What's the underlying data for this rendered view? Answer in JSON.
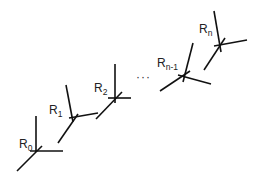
{
  "diagram": {
    "type": "serial kinematic chain of coordinate frames",
    "line_color": "#111111",
    "background": "#ffffff",
    "frames": [
      {
        "id": "R0",
        "base": "R",
        "sub": "0"
      },
      {
        "id": "R1",
        "base": "R",
        "sub": "1"
      },
      {
        "id": "R2",
        "base": "R",
        "sub": "2"
      },
      {
        "id": "Rn-1",
        "base": "R",
        "sub": "n-1"
      },
      {
        "id": "Rn",
        "base": "R",
        "sub": "n"
      }
    ],
    "ellipsis": "···"
  }
}
